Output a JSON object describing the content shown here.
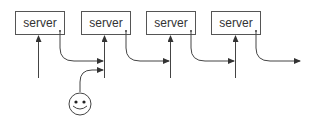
{
  "diagram": {
    "servers": [
      {
        "label": "server",
        "x": 15,
        "cx": 38
      },
      {
        "label": "server",
        "x": 81,
        "cx": 104
      },
      {
        "label": "server",
        "x": 146,
        "cx": 170
      },
      {
        "label": "server",
        "x": 211,
        "cx": 235
      }
    ],
    "client": {
      "icon": "smiley-face-icon"
    },
    "colors": {
      "stroke": "#444444",
      "box_border": "#555555",
      "text": "#333333",
      "background": "#ffffff"
    }
  }
}
